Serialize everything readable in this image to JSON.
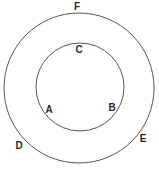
{
  "diagram": {
    "type": "concentric-circles",
    "stroke_color": "#555555",
    "background": "#ffffff",
    "circles": [
      {
        "id": "outer",
        "cx": 79,
        "cy": 88,
        "r": 75
      },
      {
        "id": "inner",
        "cx": 80,
        "cy": 87,
        "r": 44
      }
    ],
    "labels": [
      {
        "text": "F",
        "x": 77,
        "y": 10
      },
      {
        "text": "C",
        "x": 79,
        "y": 53
      },
      {
        "text": "A",
        "x": 49,
        "y": 113
      },
      {
        "text": "B",
        "x": 112,
        "y": 111
      },
      {
        "text": "D",
        "x": 19,
        "y": 149
      },
      {
        "text": "E",
        "x": 143,
        "y": 142
      }
    ]
  }
}
